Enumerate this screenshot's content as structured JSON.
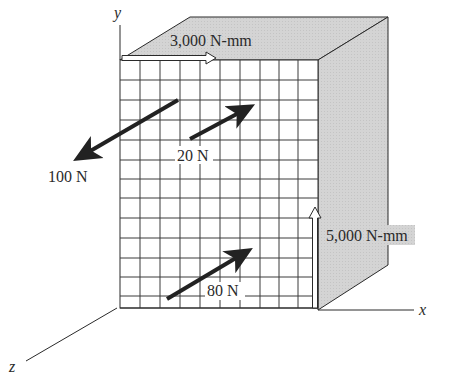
{
  "figure": {
    "axes": {
      "x": "x",
      "y": "y",
      "z": "z"
    },
    "colors": {
      "face_shade": "#d2d2d2",
      "line": "#2a2a2a",
      "arrow": "#222222",
      "background": "#ffffff"
    },
    "grid": {
      "columns": 10,
      "rows": 13
    },
    "loads": {
      "top_moment": {
        "label": "3,000 N-mm",
        "type": "couple",
        "direction": "+x along top edge"
      },
      "side_moment": {
        "label": "5,000 N-mm",
        "type": "couple",
        "direction": "+y along right edge"
      },
      "force_100": {
        "label": "100 N",
        "direction": "toward -x, +z (down-left)"
      },
      "force_20": {
        "label": "20 N",
        "direction": "toward +x, -z (up-right)"
      },
      "force_80": {
        "label": "80 N",
        "direction": "toward +x, -z (up-right)"
      }
    }
  }
}
